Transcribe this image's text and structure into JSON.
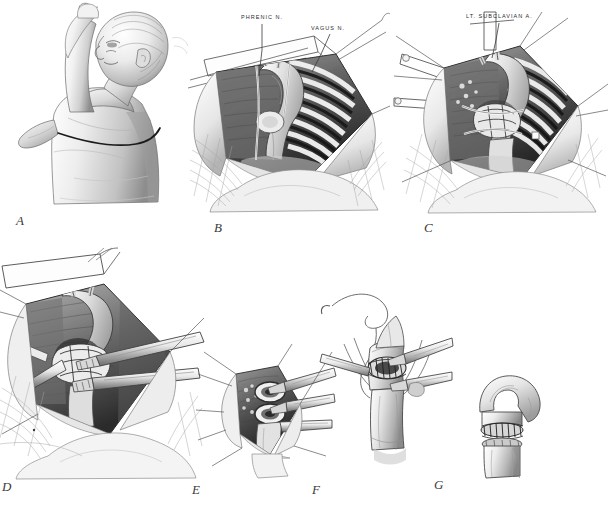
{
  "figure": {
    "type": "surgical-illustration-plate",
    "technique": "graphite pencil rendering, grayscale",
    "background_color": "#ffffff",
    "ink_color": "#2b2b2b",
    "panel_count": 7
  },
  "annotations": [
    {
      "id": "phrenic",
      "text": "PHRENIC N.",
      "panel": "B",
      "x": 241,
      "y": 14
    },
    {
      "id": "vagus",
      "text": "VAGUS N.",
      "panel": "B",
      "x": 311,
      "y": 25
    },
    {
      "id": "subclavian",
      "text": "LT. SUBCLAVIAN A.",
      "panel": "C",
      "x": 503,
      "y": 13
    }
  ],
  "panels": [
    {
      "letter": "A",
      "x": 16,
      "y": 213,
      "caption": "Infant in right lateral decubitus position with left arm elevated; skin incision line marked over the left posterolateral chest."
    },
    {
      "letter": "B",
      "x": 214,
      "y": 220,
      "caption": "Left thoracotomy exposure through the fourth intercostal space; ribs retracted, lung reflected, phrenic and vagus nerves identified."
    },
    {
      "letter": "C",
      "x": 424,
      "y": 220,
      "caption": "Mediastinal pleura opened with stay sutures; aortic arch, left subclavian artery and coarctation segment dissected free."
    },
    {
      "letter": "D",
      "x": 2,
      "y": 479,
      "caption": "Magnified operative field; vascular clamps applied proximally and distally, ductal tissue and coarctation segment excised."
    },
    {
      "letter": "E",
      "x": 192,
      "y": 482,
      "caption": "Close-up of the transected aortic ends held by clamps and forceps prior to anastomosis."
    },
    {
      "letter": "F",
      "x": 312,
      "y": 482,
      "caption": "Continuous suture anastomosis of the posterior and anterior walls with long suture tails and curved needle."
    },
    {
      "letter": "G",
      "x": 434,
      "y": 477,
      "caption": "Completed end-to-end anastomosis of the descending aorta."
    }
  ]
}
